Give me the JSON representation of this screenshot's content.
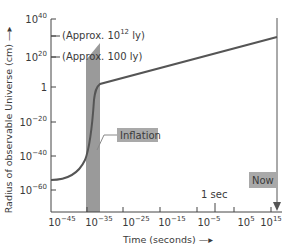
{
  "chart_data": {
    "type": "line",
    "title": "",
    "xlabel": "Time (seconds)",
    "ylabel": "Radius of observable Universe (cm)",
    "x_scale": "log10",
    "y_scale": "log10",
    "xlim_exp": [
      -47,
      18
    ],
    "ylim_exp": [
      -70,
      40
    ],
    "x_ticks": [
      {
        "exp": -45,
        "label": "10",
        "sup": "−45"
      },
      {
        "exp": -35,
        "label": "10",
        "sup": "−35"
      },
      {
        "exp": -25,
        "label": "10",
        "sup": "−25"
      },
      {
        "exp": -15,
        "label": "10",
        "sup": "−15"
      },
      {
        "exp": -5,
        "label": "10",
        "sup": "−5"
      },
      {
        "exp": 5,
        "label": "10",
        "sup": "5"
      },
      {
        "exp": 15,
        "label": "10",
        "sup": "15"
      }
    ],
    "y_ticks": [
      {
        "exp": 40,
        "label": "10",
        "sup": "40"
      },
      {
        "exp": 20,
        "label": "10",
        "sup": "20"
      },
      {
        "exp": 0,
        "label": "1",
        "sup": ""
      },
      {
        "exp": -20,
        "label": "10",
        "sup": "−20"
      },
      {
        "exp": -40,
        "label": "10",
        "sup": "−40"
      },
      {
        "exp": -60,
        "label": "10",
        "sup": "−60"
      }
    ],
    "series": [
      {
        "name": "Radius of observable Universe",
        "points_log10": [
          {
            "x": -47,
            "y": -57
          },
          {
            "x": -42,
            "y": -53
          },
          {
            "x": -38,
            "y": -45
          },
          {
            "x": -36,
            "y": -35
          },
          {
            "x": -35,
            "y": -15
          },
          {
            "x": -34.5,
            "y": -3
          },
          {
            "x": -33.5,
            "y": 2
          },
          {
            "x": 17.5,
            "y": 28
          }
        ]
      }
    ],
    "shaded_regions": [
      {
        "name": "Inflation",
        "x_from_exp": -36,
        "x_to_exp": -32
      }
    ],
    "annotations": [
      {
        "text": "(Approx. 10",
        "sup": "12",
        "after": " ly)",
        "y_exp": 28
      },
      {
        "text": "(Approx. 100 ly)",
        "y_exp": 20
      },
      {
        "text": "Inflation"
      },
      {
        "text": "1 sec",
        "x_exp": 0
      },
      {
        "text": "Now",
        "x_exp": 17.5
      }
    ],
    "grid": false,
    "legend": "none"
  },
  "labels": {
    "approx_big_pre": "(Approx. 10",
    "approx_big_sup": "12",
    "approx_big_post": " ly)",
    "approx_small": "(Approx. 100 ly)",
    "inflation": "Inflation",
    "one_sec": "1 sec",
    "now": "Now",
    "xlabel": "Time (seconds) —▸",
    "ylabel": "Radius of observable Universe (cm) —▸"
  },
  "colors": {
    "curve": "#555555",
    "band": "#9a9a9a",
    "label_box": "#a9a9a9",
    "axis": "#444444"
  }
}
